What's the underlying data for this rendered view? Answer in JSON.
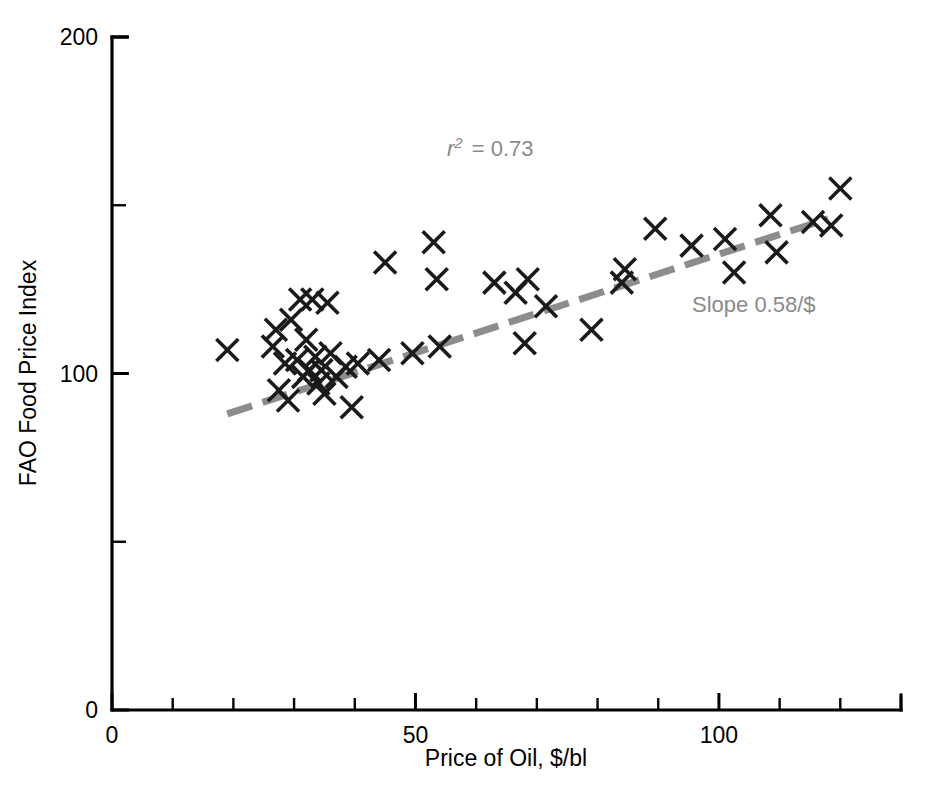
{
  "chart_data": {
    "type": "scatter",
    "title": "",
    "xlabel": "Price of Oil, $/bl",
    "ylabel": "FAO Food Price Index",
    "xlim": [
      0,
      130
    ],
    "ylim": [
      0,
      200
    ],
    "grid": false,
    "legend": "none",
    "x_ticks_major": [
      0,
      50,
      100
    ],
    "x_tick_labels": [
      "0",
      "50",
      "100"
    ],
    "x_ticks_minor": [
      10,
      20,
      30,
      40,
      60,
      70,
      80,
      90,
      110,
      120,
      130
    ],
    "y_ticks_major": [
      0,
      100,
      200
    ],
    "y_tick_labels": [
      "0",
      "100",
      "200"
    ],
    "y_ticks_minor": [
      50,
      150
    ],
    "marker": "x",
    "marker_color": "#1a1a1a",
    "points": [
      {
        "x": 19.0,
        "y": 107.0
      },
      {
        "x": 26.5,
        "y": 108.0
      },
      {
        "x": 27.0,
        "y": 113.0
      },
      {
        "x": 27.5,
        "y": 95.0
      },
      {
        "x": 28.5,
        "y": 103.0
      },
      {
        "x": 29.0,
        "y": 92.0
      },
      {
        "x": 29.5,
        "y": 116.0
      },
      {
        "x": 30.5,
        "y": 104.0
      },
      {
        "x": 31.0,
        "y": 122.0
      },
      {
        "x": 31.5,
        "y": 99.0
      },
      {
        "x": 32.0,
        "y": 110.0
      },
      {
        "x": 32.5,
        "y": 101.0
      },
      {
        "x": 33.0,
        "y": 122.0
      },
      {
        "x": 33.5,
        "y": 105.0
      },
      {
        "x": 34.0,
        "y": 97.0
      },
      {
        "x": 34.5,
        "y": 101.0
      },
      {
        "x": 35.0,
        "y": 94.0
      },
      {
        "x": 35.5,
        "y": 121.0
      },
      {
        "x": 36.0,
        "y": 106.0
      },
      {
        "x": 37.0,
        "y": 99.0
      },
      {
        "x": 38.5,
        "y": 102.0
      },
      {
        "x": 39.5,
        "y": 90.0
      },
      {
        "x": 40.5,
        "y": 103.0
      },
      {
        "x": 44.0,
        "y": 104.0
      },
      {
        "x": 45.0,
        "y": 133.0
      },
      {
        "x": 49.5,
        "y": 106.0
      },
      {
        "x": 53.0,
        "y": 139.0
      },
      {
        "x": 53.5,
        "y": 128.0
      },
      {
        "x": 54.0,
        "y": 108.0
      },
      {
        "x": 63.0,
        "y": 127.0
      },
      {
        "x": 66.5,
        "y": 124.0
      },
      {
        "x": 68.0,
        "y": 109.0
      },
      {
        "x": 68.5,
        "y": 128.0
      },
      {
        "x": 71.5,
        "y": 120.0
      },
      {
        "x": 79.0,
        "y": 113.0
      },
      {
        "x": 84.0,
        "y": 127.0
      },
      {
        "x": 84.5,
        "y": 131.0
      },
      {
        "x": 89.5,
        "y": 143.0
      },
      {
        "x": 95.5,
        "y": 138.0
      },
      {
        "x": 101.0,
        "y": 140.0
      },
      {
        "x": 102.5,
        "y": 130.0
      },
      {
        "x": 108.5,
        "y": 147.0
      },
      {
        "x": 109.5,
        "y": 136.0
      },
      {
        "x": 115.5,
        "y": 145.0
      },
      {
        "x": 118.5,
        "y": 144.0
      },
      {
        "x": 120.0,
        "y": 155.0
      }
    ],
    "trend_line": {
      "style": "dashed",
      "color": "#8c8c8c",
      "slope": 0.58,
      "x_start": 19.0,
      "y_start": 88.0,
      "x_end": 118.0,
      "y_end": 146.0
    },
    "annotations": [
      {
        "name": "r-squared",
        "text_prefix": "r",
        "text_sup": "2",
        "text_suffix": "= 0.73",
        "full_text": "r2 = 0.73",
        "color": "#8a8a8a",
        "x_px": 447,
        "y_px": 156
      },
      {
        "name": "slope",
        "full_text": "Slope 0.58/$",
        "color": "#8a8a8a",
        "x_px": 692,
        "y_px": 312
      }
    ]
  },
  "axes": {
    "x_title": "Price of Oil, $/bl",
    "y_title": "FAO Food Price Index",
    "x_labels": [
      "0",
      "50",
      "100"
    ],
    "y_labels": [
      "0",
      "100",
      "200"
    ]
  }
}
